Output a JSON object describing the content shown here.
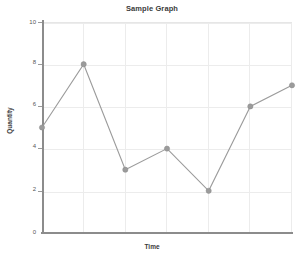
{
  "chart_data": {
    "type": "line",
    "title": "Sample Graph",
    "xlabel": "Time",
    "ylabel": "Quantity",
    "x": [
      1,
      2,
      3,
      4,
      5,
      6,
      7
    ],
    "values": [
      5,
      8,
      3,
      4,
      2,
      6,
      7
    ],
    "series": [
      {
        "name": "Quantity",
        "values": [
          5,
          8,
          3,
          4,
          2,
          6,
          7
        ]
      }
    ],
    "ylim": [
      0,
      10
    ],
    "yticks": [
      0,
      2,
      4,
      6,
      8,
      10
    ],
    "ytick_labels": [
      "0",
      "2",
      "4",
      "6",
      "8",
      "10"
    ],
    "xticks": [
      1,
      2,
      3,
      4,
      5,
      6,
      7
    ],
    "xtick_labels": [
      "",
      "",
      "",
      "",
      "",
      "",
      ""
    ],
    "grid": true,
    "legend": false,
    "line_color": "#9b9b9b",
    "marker_color": "#9b9b9b",
    "marker": "circle",
    "grid_color": "#ececec",
    "axis_color": "#8c8c8c",
    "background": "#ffffff"
  },
  "labels": {
    "tick_0": "0",
    "tick_1": "2",
    "tick_2": "4",
    "tick_3": "6",
    "tick_4": "8",
    "tick_5": "10"
  }
}
